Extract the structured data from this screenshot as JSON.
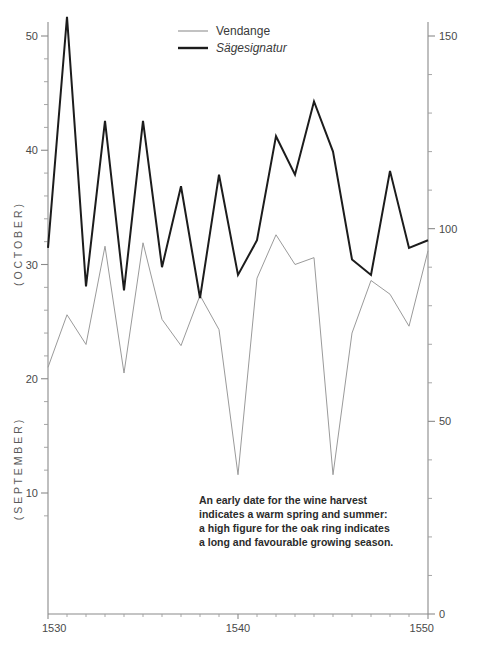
{
  "chart_data": {
    "type": "line",
    "title": "",
    "xlabel": "",
    "x": [
      1530,
      1531,
      1532,
      1533,
      1534,
      1535,
      1536,
      1537,
      1538,
      1539,
      1540,
      1541,
      1542,
      1543,
      1544,
      1545,
      1546,
      1547,
      1548,
      1549,
      1550
    ],
    "xlim": [
      1530,
      1550
    ],
    "xticks_major": [
      1530,
      1540,
      1550
    ],
    "xtick_labels": [
      "1530",
      "1540",
      "1550"
    ],
    "grid": false,
    "legend_position": "top-center",
    "series": [
      {
        "name": "Vendange",
        "axis": "left",
        "color": "#9a9a9a",
        "ylabel_top": "( O C T O B E R )",
        "ylabel_bottom": "( S E P T E M B E R )",
        "ylim": [
          6,
          52
        ],
        "yticks": [
          10,
          20,
          30,
          40,
          50
        ],
        "ytick_labels": [
          "10",
          "20",
          "30",
          "40",
          "50"
        ],
        "values": [
          21.0,
          25.6,
          23.0,
          31.6,
          20.5,
          31.9,
          25.2,
          22.9,
          27.3,
          24.3,
          11.6,
          28.8,
          32.6,
          30.0,
          30.6,
          11.6,
          24.0,
          28.6,
          27.4,
          24.6,
          31.2
        ]
      },
      {
        "name": "Sägesignatur",
        "axis": "right",
        "color": "#1c1c1c",
        "ylim": [
          0,
          160
        ],
        "yticks": [
          0,
          50,
          100,
          150
        ],
        "ytick_labels": [
          "0",
          "50",
          "100",
          "150"
        ],
        "values": [
          95,
          155,
          85,
          128,
          84,
          128,
          90,
          111,
          82,
          114,
          88,
          97,
          124,
          114,
          133,
          120,
          92,
          88,
          115,
          95,
          97
        ]
      }
    ],
    "annotation": {
      "lines": [
        "An early date for the wine harvest",
        "indicates a warm spring and summer:",
        "a high figure for the oak ring indicates",
        "a long and favourable growing season."
      ]
    }
  },
  "axes": {
    "left": {
      "title_upper": "( O C T O B E R )",
      "title_lower": "( S E P T E M B E R )",
      "tick_labels": [
        "50",
        "40",
        "30",
        "20",
        "10"
      ]
    },
    "right": {
      "tick_labels": [
        "150",
        "100",
        "50",
        "0"
      ]
    },
    "bottom": {
      "tick_labels": [
        "1530",
        "1540",
        "1550"
      ]
    }
  },
  "legend": {
    "items": [
      {
        "label": "Vendange",
        "swatch": "thin-gray-line",
        "italic": false
      },
      {
        "label": "Sägesignatur",
        "swatch": "thick-black-line",
        "italic": true
      }
    ]
  },
  "colors": {
    "vendange": "#9a9a9a",
    "sagesignatur": "#1c1c1c",
    "axis": "#8a8a8a",
    "background": "#ffffff"
  }
}
